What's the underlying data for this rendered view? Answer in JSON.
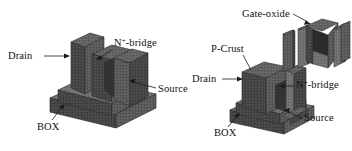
{
  "figure": {
    "background_color": "#ffffff",
    "material_color": "#5a5a5a",
    "material_color_light": "#777777",
    "material_color_dark": "#3d3d3d",
    "line_color": "#1a1a1a",
    "text_color": "#111111",
    "width": 352,
    "height": 151
  },
  "left_device": {
    "name": "finfet-structure-assembled",
    "labels": {
      "drain": "Drain",
      "n_bridge_pre": "N",
      "n_bridge_sup": "+",
      "n_bridge_post": "-bridge",
      "source": "Source",
      "box": "BOX"
    }
  },
  "right_device": {
    "name": "finfet-structure-exploded",
    "labels": {
      "gate_oxide": "Gate-oxide",
      "p_crust": "P-Crust",
      "drain": "Drain",
      "n_bridge_pre": "N",
      "n_bridge_sup": "+",
      "n_bridge_post": "-bridge",
      "source": "Source",
      "box": "BOX"
    }
  }
}
